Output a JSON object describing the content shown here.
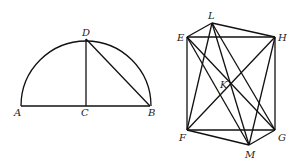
{
  "figure1": {
    "labels": {
      "A": "A",
      "B": "B",
      "C": "C",
      "D": "D"
    },
    "points": {
      "A": [
        21,
        106
      ],
      "B": [
        149,
        106
      ],
      "C": [
        86,
        106
      ],
      "D": [
        86,
        39
      ]
    },
    "segments": [
      [
        "A",
        "B"
      ],
      [
        "C",
        "D"
      ],
      [
        "D",
        "B"
      ]
    ],
    "arc": {
      "center": "C",
      "radius": 64,
      "type": "semicircle"
    }
  },
  "figure2": {
    "labels": {
      "E": "E",
      "F": "F",
      "G": "G",
      "H": "H",
      "K": "K",
      "L": "L",
      "M": "M"
    },
    "points": {
      "E": [
        187,
        37
      ],
      "H": [
        275,
        37
      ],
      "F": [
        187,
        130
      ],
      "G": [
        275,
        130
      ],
      "L": [
        212,
        23
      ],
      "M": [
        249,
        145
      ],
      "K": [
        231,
        84
      ]
    },
    "segments": [
      [
        "E",
        "H"
      ],
      [
        "H",
        "G"
      ],
      [
        "G",
        "F"
      ],
      [
        "F",
        "E"
      ],
      [
        "E",
        "G"
      ],
      [
        "F",
        "H"
      ],
      [
        "L",
        "E"
      ],
      [
        "L",
        "H"
      ],
      [
        "L",
        "F"
      ],
      [
        "L",
        "G"
      ],
      [
        "L",
        "M"
      ],
      [
        "M",
        "F"
      ],
      [
        "M",
        "G"
      ],
      [
        "M",
        "E"
      ],
      [
        "M",
        "H"
      ]
    ]
  }
}
